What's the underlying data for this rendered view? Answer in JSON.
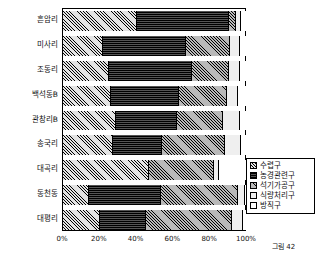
{
  "caption": "그림 42",
  "legend": {
    "items": [
      {
        "label": "수렵구",
        "key": "hunt",
        "swatch": "diagonal-light-hatch-swatch"
      },
      {
        "label": "농경관련구",
        "key": "farm",
        "swatch": "dark-solid-swatch"
      },
      {
        "label": "석기가공구",
        "key": "stone",
        "swatch": "diagonal-gray-hatch-swatch"
      },
      {
        "label": "식량처리구",
        "key": "food",
        "swatch": "vertical-light-hatch-swatch"
      },
      {
        "label": "방직구",
        "key": "weave",
        "swatch": "white-empty-swatch"
      }
    ]
  },
  "chart_data": {
    "type": "bar",
    "orientation": "horizontal",
    "stacked": "100%",
    "title": "",
    "xlabel": "",
    "ylabel": "",
    "xlim": [
      0,
      100
    ],
    "xticks": [
      "0%",
      "20%",
      "40%",
      "60%",
      "80%",
      "100%"
    ],
    "xtickvalues": [
      0,
      20,
      40,
      60,
      80,
      100
    ],
    "grid": false,
    "legend_position": "right-bottom",
    "categories": [
      "흔암리",
      "미사리",
      "조동리",
      "백석동B",
      "관창리B",
      "송국리",
      "대곡리",
      "동천동",
      "대평리"
    ],
    "series": [
      {
        "name": "수렵구",
        "values": [
          40,
          22,
          25,
          26,
          29,
          27,
          47,
          14,
          20
        ]
      },
      {
        "name": "농경관련구",
        "values": [
          50,
          45,
          45,
          37,
          33,
          27,
          0,
          39,
          25
        ]
      },
      {
        "name": "석기가공구",
        "values": [
          4,
          24,
          20,
          26,
          25,
          34,
          35,
          42,
          47
        ]
      },
      {
        "name": "식량처리구",
        "values": [
          3,
          5,
          6,
          6,
          9,
          9,
          3,
          4,
          6
        ]
      },
      {
        "name": "방직구",
        "values": [
          3,
          4,
          4,
          5,
          4,
          3,
          15,
          1,
          2
        ]
      }
    ]
  }
}
